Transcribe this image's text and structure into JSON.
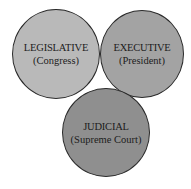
{
  "diagram": {
    "type": "three-circle branches of government",
    "branches": [
      {
        "id": "legislative",
        "title": "LEGISLATIVE",
        "subtitle": "(Congress)",
        "fill": "#b9b9b9"
      },
      {
        "id": "executive",
        "title": "EXECUTIVE",
        "subtitle": "(President)",
        "fill": "#a3a3a3"
      },
      {
        "id": "judicial",
        "title": "JUDICIAL",
        "subtitle": "(Supreme Court)",
        "fill": "#8f8f8f"
      }
    ],
    "outline_color": "#2a2a2a"
  }
}
